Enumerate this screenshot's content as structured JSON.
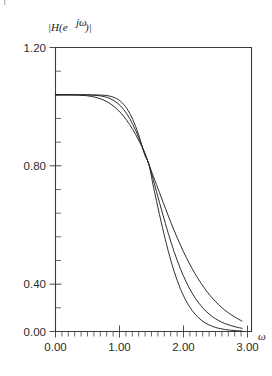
{
  "figure": {
    "background": "#ffffff",
    "axis_color": "#3a3a3a",
    "curve_color": "#222222",
    "ylabel": "|H(e",
    "ylabel_sup": "jω",
    "ylabel_tail": ")|",
    "xlabel": "ω"
  },
  "chart_data": {
    "type": "line",
    "title": "",
    "ylabel": "|H(e^{jω})|",
    "xlabel": "ω",
    "xlim": [
      0.0,
      3.3
    ],
    "ylim": [
      0.0,
      1.2
    ],
    "xticks": [
      0.0,
      1.0,
      2.0,
      3.0
    ],
    "xtick_labels": [
      "0.00",
      "1.00",
      "2.00",
      "3.00"
    ],
    "yticks": [
      0.0,
      0.4,
      0.8,
      1.2
    ],
    "ytick_labels": [
      "0.00",
      "0.40",
      "0.80",
      "1.20"
    ],
    "x_minor_tick_step": 0.1,
    "y_minor_tick_step": 0.1,
    "grid": false,
    "legend": null,
    "legend_position": "none",
    "x": [
      0.0,
      0.1,
      0.2,
      0.3,
      0.4,
      0.5,
      0.6,
      0.7,
      0.8,
      0.9,
      1.0,
      1.1,
      1.2,
      1.3,
      1.4,
      1.5,
      1.571,
      1.65,
      1.75,
      1.85,
      1.95,
      2.05,
      2.15,
      2.25,
      2.35,
      2.45,
      2.55,
      2.65,
      2.75,
      2.85,
      2.95,
      3.05,
      3.1416
    ],
    "series": [
      {
        "name": "order 3",
        "values": [
          1.0,
          1.0,
          0.9999,
          0.9996,
          0.9988,
          0.997,
          0.9936,
          0.9879,
          0.979,
          0.9659,
          0.9476,
          0.9232,
          0.892,
          0.8536,
          0.8084,
          0.7571,
          0.7071,
          0.6541,
          0.5871,
          0.5204,
          0.4561,
          0.3956,
          0.3398,
          0.2892,
          0.2439,
          0.2039,
          0.1689,
          0.1386,
          0.1126,
          0.0905,
          0.0719,
          0.0565,
          0.044
        ]
      },
      {
        "name": "order 5",
        "values": [
          1.0,
          1.0,
          1.0,
          1.0,
          0.9999,
          0.9997,
          0.999,
          0.9973,
          0.9935,
          0.9861,
          0.9729,
          0.9516,
          0.9198,
          0.8759,
          0.8198,
          0.7539,
          0.7071,
          0.6372,
          0.5459,
          0.4562,
          0.3733,
          0.2999,
          0.2371,
          0.1848,
          0.1423,
          0.1085,
          0.0819,
          0.0614,
          0.0457,
          0.0339,
          0.025,
          0.0183,
          0.0134
        ]
      },
      {
        "name": "order 7",
        "values": [
          1.0,
          1.0,
          1.0,
          1.0,
          1.0,
          1.0,
          0.9999,
          0.9996,
          0.9985,
          0.9953,
          0.9876,
          0.9716,
          0.9428,
          0.8966,
          0.8309,
          0.7482,
          0.7071,
          0.6104,
          0.4951,
          0.3874,
          0.2933,
          0.2153,
          0.1537,
          0.1072,
          0.0731,
          0.0489,
          0.0322,
          0.0209,
          0.0134,
          0.0085,
          0.0054,
          0.0034,
          0.0021
        ]
      }
    ]
  }
}
